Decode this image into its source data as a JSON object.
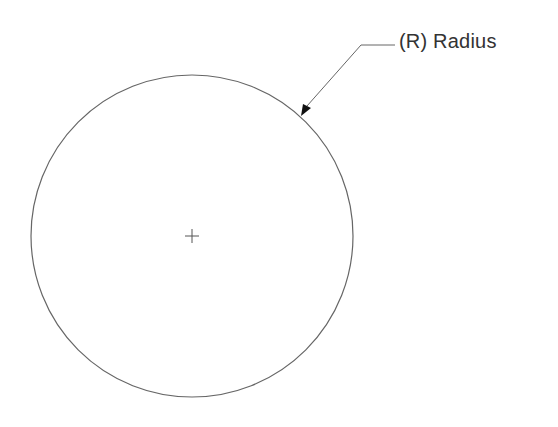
{
  "diagram": {
    "label": "(R) Radius",
    "circle": {
      "cx": 192,
      "cy": 236,
      "r": 161
    },
    "center_mark": {
      "x": 192,
      "y": 236,
      "arm": 7
    },
    "leader": {
      "text_x": 399,
      "shoulder_start_x": 361,
      "shoulder_end_x": 395,
      "y": 45,
      "arrow_tip_x": 301,
      "arrow_tip_y": 116
    },
    "colors": {
      "stroke": "#555555",
      "arrow": "#111111",
      "text": "#333333"
    }
  }
}
